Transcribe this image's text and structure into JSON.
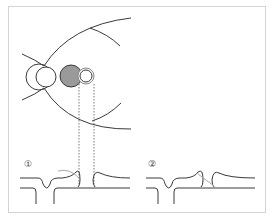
{
  "diagram": {
    "labels": {
      "step1": "①",
      "step2": "②"
    },
    "colors": {
      "line": "#3a3a3a",
      "filled_circle": "#9a9a9a",
      "frame": "#d4d4d4",
      "dotted": "#555555",
      "highlight_curve": "#a8a8a8"
    },
    "elements": {
      "top": "Eye cross-section with concentric circles, filled gray circle and small outlined circle, dotted projection lines",
      "bottom_step1": "Membrane profile with bulges and a gray arc (step 1)",
      "bottom_step2": "Membrane profile with bulges and a gray diagonal line (step 2)"
    }
  }
}
